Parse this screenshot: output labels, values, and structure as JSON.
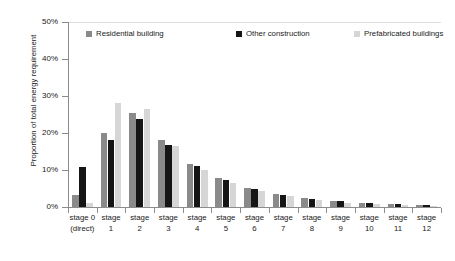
{
  "chart_data": {
    "type": "bar",
    "title": "",
    "xlabel": "",
    "ylabel": "Proportion of total energy requirement",
    "ylim": [
      0,
      50
    ],
    "ytick_labels": [
      "0%",
      "10%",
      "20%",
      "30%",
      "40%",
      "50%"
    ],
    "ytick_values": [
      0,
      10,
      20,
      30,
      40,
      50
    ],
    "grid": false,
    "legend_position": "top-inside",
    "categories": [
      "stage 0 (direct)",
      "stage 1",
      "stage 2",
      "stage 3",
      "stage 4",
      "stage 5",
      "stage 6",
      "stage 7",
      "stage 8",
      "stage 9",
      "stage 10",
      "stage 11",
      "stage 12"
    ],
    "category_lines": [
      [
        "stage 0",
        "(direct)"
      ],
      [
        "stage",
        "1"
      ],
      [
        "stage",
        "2"
      ],
      [
        "stage",
        "3"
      ],
      [
        "stage",
        "4"
      ],
      [
        "stage",
        "5"
      ],
      [
        "stage",
        "6"
      ],
      [
        "stage",
        "7"
      ],
      [
        "stage",
        "8"
      ],
      [
        "stage",
        "9"
      ],
      [
        "stage",
        "10"
      ],
      [
        "stage",
        "11"
      ],
      [
        "stage",
        "12"
      ]
    ],
    "series": [
      {
        "name": "Residential building",
        "color": "#8a8a8a",
        "values": [
          3.2,
          20.0,
          25.5,
          18.1,
          11.7,
          7.8,
          5.2,
          3.4,
          2.4,
          1.6,
          1.2,
          0.8,
          0.5
        ]
      },
      {
        "name": "Other construction",
        "color": "#151515",
        "values": [
          10.9,
          18.0,
          23.7,
          16.8,
          11.0,
          7.3,
          4.9,
          3.3,
          2.3,
          1.6,
          1.1,
          0.8,
          0.5
        ]
      },
      {
        "name": "Prefabricated buildings",
        "color": "#d6d6d6",
        "values": [
          1.2,
          28.1,
          26.5,
          16.5,
          10.0,
          6.4,
          4.2,
          2.9,
          1.8,
          1.2,
          0.7,
          0.5,
          0.3
        ]
      }
    ]
  },
  "legend": {
    "items": [
      {
        "label": "Residential building",
        "color": "#8a8a8a"
      },
      {
        "label": "Other construction",
        "color": "#151515"
      },
      {
        "label": "Prefabricated buildings",
        "color": "#d6d6d6"
      }
    ]
  },
  "axes": {
    "y_title": "Proportion of total energy requirement"
  }
}
